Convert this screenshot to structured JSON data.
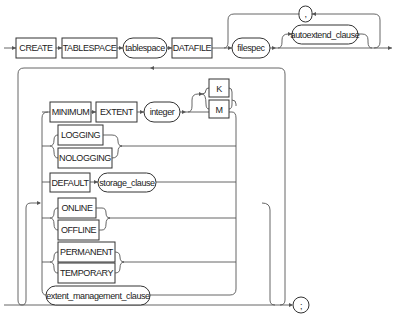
{
  "diagram": {
    "type": "railroad-syntax-diagram",
    "statement": "CREATE TABLESPACE",
    "main_sequence": [
      {
        "kind": "keyword",
        "label": "CREATE"
      },
      {
        "kind": "keyword",
        "label": "TABLESPACE"
      },
      {
        "kind": "nonterminal",
        "label": "tablespace"
      },
      {
        "kind": "keyword",
        "label": "DATAFILE"
      },
      {
        "kind": "nonterminal",
        "label": "filespec"
      },
      {
        "kind": "nonterminal",
        "label": "autoextend_clause",
        "optional": true
      },
      {
        "kind": "separator",
        "label": ",",
        "repeat": true
      }
    ],
    "options_loop": {
      "minimum_extent": {
        "minimum": "MINIMUM",
        "extent": "EXTENT",
        "integer": "integer",
        "units": [
          "K",
          "M"
        ]
      },
      "logging": [
        "LOGGING",
        "NOLOGGING"
      ],
      "default": {
        "keyword": "DEFAULT",
        "clause": "storage_clause"
      },
      "online": [
        "ONLINE",
        "OFFLINE"
      ],
      "permanence": [
        "PERMANENT",
        "TEMPORARY"
      ],
      "extent_management": "extent_management_clause"
    },
    "terminator": ";"
  }
}
